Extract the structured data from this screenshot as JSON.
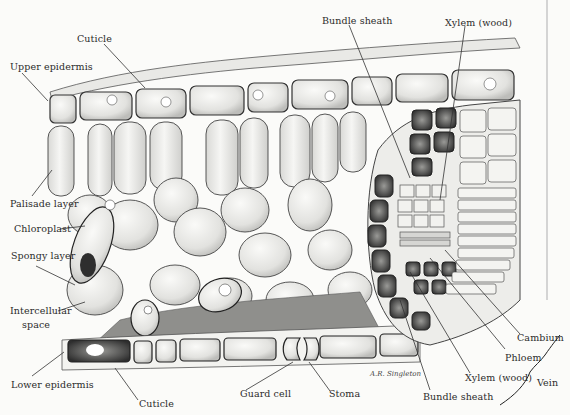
{
  "figure": {
    "signature": "A.R. Singleton",
    "labels": {
      "cuticle_top": "Cuticle",
      "upper_epidermis": "Upper epidermis",
      "palisade_layer": "Palisade layer",
      "chloroplast": "Chloroplast",
      "spongy_layer": "Spongy layer",
      "intercellular_space_1": "Intercellular",
      "intercellular_space_2": "space",
      "lower_epidermis": "Lower epidermis",
      "cuticle_bottom": "Cuticle",
      "guard_cell": "Guard cell",
      "stoma": "Stoma",
      "bundle_sheath_top": "Bundle sheath",
      "xylem_top": "Xylem (wood)",
      "cambium": "Cambium",
      "phloem": "Phloem",
      "xylem_bottom": "Xylem (wood)",
      "bundle_sheath_bottom": "Bundle sheath",
      "vein": "Vein"
    },
    "colors": {
      "ink": "#2b2b2b",
      "paper": "#fbfbf9",
      "cell_fill": "#ececea",
      "cell_shade": "#c9c9c6",
      "intercellular_gray": "#8f8f8c",
      "dark_cell": "#3a3a3a"
    }
  }
}
